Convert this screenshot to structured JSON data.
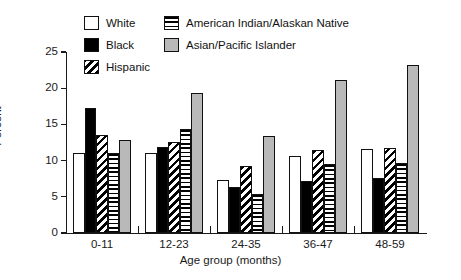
{
  "chart_data": {
    "type": "bar",
    "title": "",
    "subtitle": "",
    "xlabel": "Age group (months)",
    "ylabel": "Percent",
    "categories": [
      "0-11",
      "12-23",
      "24-35",
      "36-47",
      "48-59"
    ],
    "series": [
      {
        "name": "White",
        "pattern": "outline-white",
        "color": "#ffffff",
        "values": [
          11.0,
          11.0,
          7.3,
          10.7,
          11.6
        ]
      },
      {
        "name": "Black",
        "pattern": "solid-black",
        "color": "#000000",
        "values": [
          17.3,
          11.9,
          6.4,
          7.2,
          7.6
        ]
      },
      {
        "name": "Hispanic",
        "pattern": "diagonal-stripe",
        "color": "#000000",
        "values": [
          13.6,
          12.6,
          9.2,
          11.5,
          11.7
        ]
      },
      {
        "name": "American Indian/Alaskan Native",
        "pattern": "horizontal-stripe",
        "color": "#000000",
        "values": [
          11.1,
          14.3,
          5.4,
          9.5,
          9.7
        ]
      },
      {
        "name": "Asian/Pacific Islander",
        "pattern": "solid-gray",
        "color": "#b9b9b9",
        "values": [
          12.9,
          19.3,
          13.4,
          21.2,
          23.2
        ]
      }
    ],
    "ylim": [
      0,
      25
    ],
    "yticks": [
      0,
      5,
      10,
      15,
      20,
      25
    ],
    "ytick_labels": [
      "0",
      "5",
      "10",
      "15",
      "20",
      "25"
    ],
    "grid": false,
    "legend_position": "top"
  },
  "legend": {
    "left_column": [
      {
        "label": "White",
        "swatch": "outline-white"
      },
      {
        "label": "Black",
        "swatch": "solid-black"
      },
      {
        "label": "Hispanic",
        "swatch": "diagonal-stripe"
      }
    ],
    "right_column": [
      {
        "label": "American Indian/Alaskan Native",
        "swatch": "horizontal-stripe"
      },
      {
        "label": "Asian/Pacific Islander",
        "swatch": "solid-gray"
      }
    ]
  }
}
